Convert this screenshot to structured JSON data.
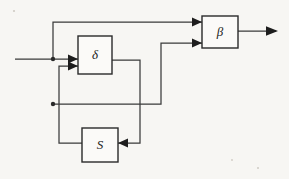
{
  "diagram": {
    "type": "block-diagram",
    "title": "",
    "background_color": "#f7f6f3",
    "line_color": "#3a3a3a",
    "box_fill": "#fbfaf8",
    "box_stroke": "#2a2a2a",
    "blocks": [
      {
        "id": "delta",
        "label": "δ",
        "name": "delta-block",
        "x": 78,
        "y": 36,
        "w": 34,
        "h": 38
      },
      {
        "id": "beta",
        "label": "β",
        "name": "beta-block",
        "x": 202,
        "y": 16,
        "w": 36,
        "h": 32
      },
      {
        "id": "s",
        "label": "S",
        "name": "s-block",
        "x": 82,
        "y": 128,
        "w": 36,
        "h": 34
      }
    ],
    "junctions": [
      {
        "id": "j-input",
        "name": "input-junction",
        "x": 53,
        "y": 59
      },
      {
        "id": "j-mid",
        "name": "mid-junction",
        "x": 53,
        "y": 104
      }
    ],
    "ports": {
      "external_input": {
        "name": "external-input-line",
        "x": 15,
        "y": 59
      },
      "external_output": {
        "name": "external-output-arrow",
        "x": 278,
        "y": 31
      }
    },
    "connections": [
      {
        "name": "input-to-delta",
        "from": "external-input",
        "to": "delta-top-input"
      },
      {
        "name": "input-branch-to-beta",
        "from": "input-junction",
        "to": "beta-top-input"
      },
      {
        "name": "delta-out-to-s",
        "from": "delta-output",
        "to": "s-right-input"
      },
      {
        "name": "s-out-to-delta",
        "from": "s-output",
        "to": "delta-bottom-input"
      },
      {
        "name": "mid-branch-to-beta",
        "from": "mid-junction",
        "to": "beta-bottom-input"
      },
      {
        "name": "beta-to-output",
        "from": "beta-output",
        "to": "external-output"
      }
    ],
    "arrowheads": [
      {
        "name": "arrowhead-delta-top",
        "x": 78,
        "y": 59,
        "dir": "right"
      },
      {
        "name": "arrowhead-delta-bottom",
        "x": 78,
        "y": 66,
        "dir": "right"
      },
      {
        "name": "arrowhead-beta-top",
        "x": 202,
        "y": 22,
        "dir": "right"
      },
      {
        "name": "arrowhead-beta-bottom",
        "x": 202,
        "y": 43,
        "dir": "right"
      },
      {
        "name": "arrowhead-s-input",
        "x": 118,
        "y": 143,
        "dir": "left"
      },
      {
        "name": "arrowhead-output",
        "x": 278,
        "y": 31,
        "dir": "right"
      }
    ]
  }
}
